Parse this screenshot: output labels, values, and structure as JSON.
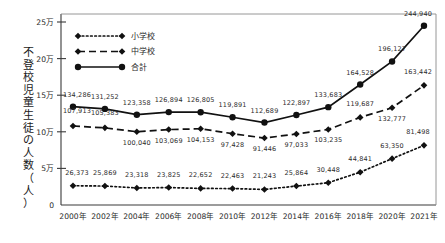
{
  "chart_data": {
    "type": "line",
    "title": "",
    "xlabel": "",
    "ylabel": "不登校児童生徒の人数(人)",
    "ylim": [
      0,
      250000
    ],
    "grid": false,
    "legend_position": "top-left",
    "categories": [
      "2000年",
      "2002年",
      "2004年",
      "2006年",
      "2008年",
      "2010年",
      "2012年",
      "2014年",
      "2016年",
      "2018年",
      "2020年",
      "2021年"
    ],
    "ytick_labels": [
      "0",
      "5万",
      "10万",
      "15万",
      "20万",
      "25万"
    ],
    "ytick_values": [
      0,
      50000,
      100000,
      150000,
      200000,
      250000
    ],
    "series": [
      {
        "name": "小学校",
        "style": "dotted",
        "marker": "diamond",
        "values": [
          26373,
          25869,
          23318,
          23825,
          22652,
          22463,
          21243,
          25864,
          30448,
          44841,
          63350,
          81498
        ],
        "labels": [
          "26,373",
          "25,869",
          "23,318",
          "23,825",
          "22,652",
          "22,463",
          "21,243",
          "25,864",
          "30,448",
          "44,841",
          "63,350",
          "81,498"
        ]
      },
      {
        "name": "中学校",
        "style": "dashed",
        "marker": "diamond",
        "values": [
          107913,
          105383,
          100040,
          103069,
          104153,
          97428,
          91446,
          97033,
          103235,
          119687,
          132777,
          163442
        ],
        "labels": [
          "107,913",
          "105,383",
          "100,040",
          "103,069",
          "104,153",
          "97,428",
          "91,446",
          "97,033",
          "103,235",
          "119,687",
          "132,777",
          "163,442"
        ]
      },
      {
        "name": "合計",
        "style": "solid",
        "marker": "circle",
        "values": [
          134286,
          131252,
          123358,
          126894,
          126805,
          119891,
          112689,
          122897,
          133683,
          164528,
          196127,
          244940
        ],
        "labels": [
          "134,286",
          "131,252",
          "123,358",
          "126,894",
          "126,805",
          "119,891",
          "112,689",
          "122,897",
          "133,683",
          "164,528",
          "196,127",
          "244,940"
        ]
      }
    ]
  },
  "axis_title_chars": [
    "不",
    "登",
    "校",
    "児",
    "童",
    "生",
    "徒",
    "の",
    "人",
    "数",
    "（",
    "人",
    "）"
  ],
  "colors": {
    "line": "#111111",
    "axis": "#3a3a3a",
    "text": "#2b2b2b",
    "border": "#8a8a8a",
    "background": "#ffffff"
  }
}
